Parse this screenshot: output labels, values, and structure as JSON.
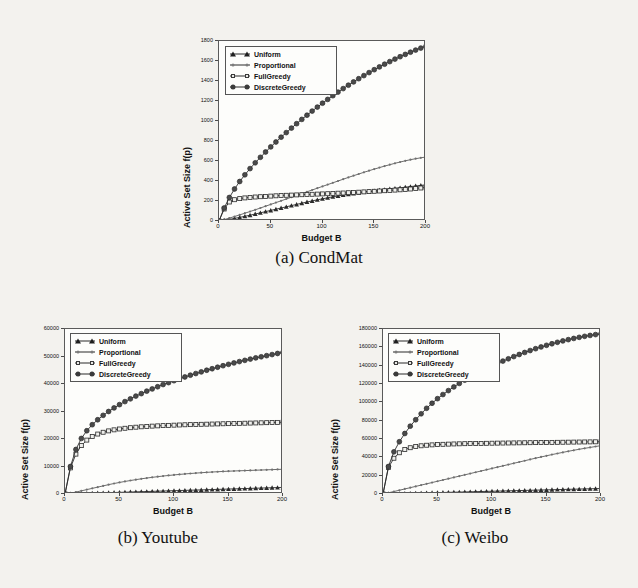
{
  "figure": {
    "background_color": "#f3f2ee",
    "series_color": "#2b2b2b",
    "panels": [
      "condmat",
      "youtube",
      "weibo"
    ]
  },
  "legend": {
    "entries": [
      {
        "label": "Uniform",
        "marker": "triangle-marker"
      },
      {
        "label": "Proportional",
        "marker": "dot-marker"
      },
      {
        "label": "FullGreedy",
        "marker": "square-marker"
      },
      {
        "label": "DiscreteGreedy",
        "marker": "circle-marker"
      }
    ]
  },
  "captions": {
    "a": "(a) CondMat",
    "b": "(b) Youtube",
    "c": "(c) Weibo"
  },
  "chart_data": [
    {
      "id": "condmat",
      "type": "line",
      "title": "(a) CondMat",
      "xlabel": "Budget B",
      "ylabel": "Active Set Size f(p)",
      "xlim": [
        0,
        200
      ],
      "ylim": [
        0,
        1800
      ],
      "xticks": [
        0,
        50,
        100,
        150,
        200
      ],
      "yticks": [
        0,
        200,
        400,
        600,
        800,
        1000,
        1200,
        1400,
        1600,
        1800
      ],
      "grid": false,
      "legend_position": "upper-left",
      "x": [
        0,
        5,
        10,
        15,
        20,
        25,
        30,
        35,
        40,
        45,
        50,
        55,
        60,
        65,
        70,
        75,
        80,
        85,
        90,
        95,
        100,
        105,
        110,
        115,
        120,
        125,
        130,
        135,
        140,
        145,
        150,
        155,
        160,
        165,
        170,
        175,
        180,
        185,
        190,
        195,
        200
      ],
      "series": [
        {
          "name": "Uniform",
          "marker": "triangle-marker",
          "values": [
            0,
            8,
            16,
            26,
            36,
            47,
            58,
            70,
            82,
            94,
            106,
            118,
            130,
            142,
            154,
            166,
            178,
            190,
            201,
            212,
            222,
            232,
            242,
            251,
            260,
            268,
            276,
            283,
            290,
            296,
            302,
            308,
            314,
            320,
            326,
            332,
            338,
            344,
            350,
            356,
            362
          ]
        },
        {
          "name": "Proportional",
          "marker": "dot-marker",
          "values": [
            0,
            14,
            29,
            45,
            61,
            78,
            95,
            112,
            130,
            148,
            166,
            184,
            202,
            220,
            238,
            256,
            274,
            292,
            310,
            328,
            346,
            364,
            382,
            400,
            418,
            436,
            453,
            470,
            487,
            503,
            519,
            534,
            549,
            563,
            577,
            590,
            602,
            613,
            623,
            632,
            640
          ]
        },
        {
          "name": "FullGreedy",
          "marker": "square-marker",
          "values": [
            0,
            120,
            190,
            213,
            224,
            231,
            236,
            240,
            243,
            246,
            249,
            252,
            255,
            257,
            259,
            261,
            263,
            265,
            267,
            269,
            271,
            273,
            276,
            278,
            280,
            283,
            285,
            288,
            291,
            294,
            297,
            300,
            303,
            306,
            309,
            312,
            316,
            320,
            325,
            330,
            336
          ]
        },
        {
          "name": "DiscreteGreedy",
          "marker": "circle-marker",
          "values": [
            0,
            130,
            235,
            320,
            395,
            462,
            524,
            582,
            637,
            690,
            741,
            790,
            838,
            884,
            929,
            973,
            1016,
            1058,
            1099,
            1139,
            1178,
            1216,
            1253,
            1289,
            1324,
            1358,
            1391,
            1423,
            1454,
            1484,
            1513,
            1541,
            1568,
            1594,
            1619,
            1643,
            1666,
            1688,
            1709,
            1729,
            1748
          ]
        }
      ]
    },
    {
      "id": "youtube",
      "type": "line",
      "title": "(b) Youtube",
      "xlabel": "Budget B",
      "ylabel": "Active Set Size f(p)",
      "xlim": [
        0,
        200
      ],
      "ylim": [
        0,
        60000
      ],
      "xticks": [
        0,
        50,
        100,
        150,
        200
      ],
      "yticks": [
        0,
        10000,
        20000,
        30000,
        40000,
        50000,
        60000
      ],
      "grid": false,
      "legend_position": "upper-left",
      "x": [
        0,
        5,
        10,
        15,
        20,
        25,
        30,
        35,
        40,
        45,
        50,
        55,
        60,
        65,
        70,
        75,
        80,
        85,
        90,
        95,
        100,
        105,
        110,
        115,
        120,
        125,
        130,
        135,
        140,
        145,
        150,
        155,
        160,
        165,
        170,
        175,
        180,
        185,
        190,
        195,
        200
      ],
      "series": [
        {
          "name": "Uniform",
          "marker": "triangle-marker",
          "values": [
            0,
            60,
            120,
            180,
            240,
            300,
            360,
            420,
            480,
            540,
            600,
            660,
            720,
            780,
            840,
            900,
            960,
            1020,
            1080,
            1140,
            1200,
            1260,
            1320,
            1380,
            1440,
            1500,
            1560,
            1620,
            1680,
            1740,
            1800,
            1860,
            1920,
            1980,
            2040,
            2100,
            2160,
            2220,
            2280,
            2340,
            2400
          ]
        },
        {
          "name": "Proportional",
          "marker": "dot-marker",
          "values": [
            0,
            300,
            700,
            1150,
            1600,
            2050,
            2500,
            2950,
            3400,
            3820,
            4200,
            4560,
            4900,
            5220,
            5520,
            5800,
            6060,
            6300,
            6530,
            6740,
            6940,
            7120,
            7290,
            7450,
            7600,
            7740,
            7870,
            7990,
            8100,
            8200,
            8290,
            8370,
            8440,
            8510,
            8580,
            8650,
            8720,
            8790,
            8860,
            8930,
            9000
          ]
        },
        {
          "name": "FullGreedy",
          "marker": "square-marker",
          "values": [
            0,
            9500,
            14500,
            17600,
            19600,
            20900,
            21800,
            22450,
            22950,
            23330,
            23640,
            23900,
            24110,
            24290,
            24440,
            24570,
            24680,
            24780,
            24870,
            24950,
            25030,
            25100,
            25170,
            25230,
            25290,
            25340,
            25390,
            25440,
            25490,
            25540,
            25590,
            25640,
            25690,
            25740,
            25790,
            25840,
            25890,
            25940,
            25990,
            26040,
            26100
          ]
        },
        {
          "name": "DiscreteGreedy",
          "marker": "circle-marker",
          "values": [
            0,
            10000,
            16200,
            20200,
            23000,
            25200,
            27000,
            28600,
            30000,
            31300,
            32500,
            33600,
            34600,
            35600,
            36500,
            37400,
            38200,
            39000,
            39800,
            40500,
            41200,
            41900,
            42550,
            43200,
            43800,
            44400,
            45000,
            45550,
            46100,
            46650,
            47150,
            47650,
            48150,
            48600,
            49050,
            49500,
            49900,
            50300,
            50700,
            51100,
            51500
          ]
        }
      ]
    },
    {
      "id": "weibo",
      "type": "line",
      "title": "(c) Weibo",
      "xlabel": "Budget B",
      "ylabel": "Active Set Size f(p)",
      "xlim": [
        0,
        200
      ],
      "ylim": [
        0,
        180000
      ],
      "xticks": [
        0,
        50,
        100,
        150,
        200
      ],
      "yticks": [
        0,
        20000,
        40000,
        60000,
        80000,
        100000,
        120000,
        140000,
        160000,
        180000
      ],
      "grid": false,
      "legend_position": "upper-left",
      "x": [
        0,
        5,
        10,
        15,
        20,
        25,
        30,
        35,
        40,
        45,
        50,
        55,
        60,
        65,
        70,
        75,
        80,
        85,
        90,
        95,
        100,
        105,
        110,
        115,
        120,
        125,
        130,
        135,
        140,
        145,
        150,
        155,
        160,
        165,
        170,
        175,
        180,
        185,
        190,
        195,
        200
      ],
      "series": [
        {
          "name": "Uniform",
          "marker": "triangle-marker",
          "values": [
            0,
            150,
            300,
            450,
            600,
            750,
            900,
            1050,
            1200,
            1350,
            1500,
            1650,
            1800,
            1950,
            2100,
            2250,
            2400,
            2550,
            2700,
            2850,
            3000,
            3150,
            3300,
            3450,
            3600,
            3750,
            3900,
            4050,
            4200,
            4350,
            4500,
            4650,
            4800,
            4950,
            5100,
            5250,
            5400,
            5550,
            5700,
            5850,
            6000
          ]
        },
        {
          "name": "Proportional",
          "marker": "dot-marker",
          "values": [
            0,
            1300,
            2700,
            4100,
            5500,
            6900,
            8300,
            9700,
            11100,
            12500,
            13900,
            15300,
            16700,
            18100,
            19500,
            20900,
            22300,
            23700,
            25100,
            26500,
            27900,
            29300,
            30700,
            32100,
            33500,
            34900,
            36300,
            37700,
            39100,
            40400,
            41700,
            43000,
            44200,
            45400,
            46600,
            47700,
            48800,
            49800,
            50800,
            51800,
            52800
          ]
        },
        {
          "name": "FullGreedy",
          "marker": "square-marker",
          "values": [
            0,
            29000,
            39000,
            45000,
            48500,
            50500,
            51800,
            52600,
            53200,
            53600,
            53950,
            54200,
            54400,
            54600,
            54750,
            54900,
            55000,
            55100,
            55200,
            55300,
            55400,
            55500,
            55580,
            55660,
            55740,
            55820,
            55900,
            55980,
            56060,
            56140,
            56220,
            56300,
            56380,
            56460,
            56540,
            56620,
            56700,
            56780,
            56860,
            56940,
            57000
          ]
        },
        {
          "name": "DiscreteGreedy",
          "marker": "circle-marker",
          "values": [
            0,
            30000,
            46000,
            57000,
            66000,
            74000,
            81000,
            87500,
            93500,
            99000,
            104000,
            108500,
            112800,
            116800,
            120600,
            124200,
            127600,
            130800,
            133900,
            136900,
            139700,
            142400,
            145000,
            147500,
            149900,
            152200,
            154400,
            156500,
            158500,
            160400,
            162200,
            163900,
            165500,
            167000,
            168400,
            169700,
            170900,
            172000,
            173000,
            173900,
            174700
          ]
        }
      ]
    }
  ]
}
